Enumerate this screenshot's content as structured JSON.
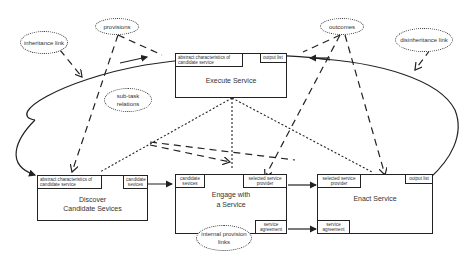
{
  "diagram": {
    "boxes": {
      "execute": {
        "title": "Execute Service",
        "ports": {
          "abstract": "abstract characteristics of candidate service",
          "output": "output list"
        }
      },
      "discover": {
        "title_line1": "Discover",
        "title_line2": "Candidate Sevices",
        "ports": {
          "abstract": "abstract characteristics of candidate service",
          "candidates": "candidate sevices"
        }
      },
      "engage": {
        "title_line1": "Engage with",
        "title_line2": "a Service",
        "ports": {
          "candidates": "candidate sevices",
          "selected": "selected service provider",
          "agreement": "service agreement"
        }
      },
      "enact": {
        "title": "Enact Service",
        "ports": {
          "selected": "selected service provider",
          "output": "output list",
          "agreement": "service agreement"
        }
      }
    },
    "annotations": {
      "inheritance": "inheritance link",
      "provisions": "provisions",
      "subtask": "sub-task relations",
      "outcomes": "outcomes",
      "disinheritance": "disinheritance link",
      "internal": "internal provision links"
    }
  }
}
